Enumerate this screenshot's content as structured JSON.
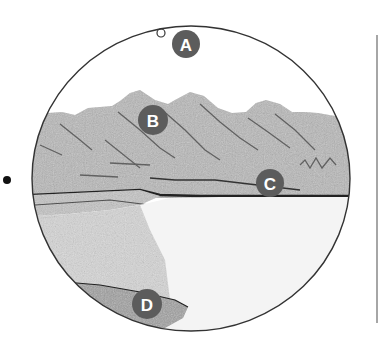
{
  "figure": {
    "type": "circular field-of-view illustration",
    "scene": "mountain landscape with lake",
    "colors": {
      "marker_fill": "#5c5c5c",
      "marker_text": "#ffffff",
      "outline": "#333333",
      "terrain": "#bdbdbd",
      "water": "#f2f2f2",
      "vertical_line": "#888888"
    }
  },
  "markers": [
    {
      "label": "A",
      "x": 186,
      "y": 44,
      "region": "sky"
    },
    {
      "label": "B",
      "x": 153,
      "y": 120,
      "region": "mountain peak"
    },
    {
      "label": "C",
      "x": 270,
      "y": 183,
      "region": "far shoreline"
    },
    {
      "label": "D",
      "x": 147,
      "y": 302,
      "region": "foreground rock"
    }
  ],
  "small_circle": {
    "x": 161,
    "y": 33,
    "r": 4
  },
  "dot": {
    "x": 7,
    "y": 180,
    "r": 4
  },
  "vertical_line": {
    "x": 377,
    "y1": 35,
    "y2": 323
  }
}
